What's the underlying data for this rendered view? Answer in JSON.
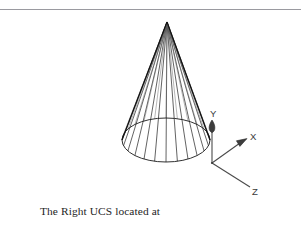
{
  "figure": {
    "title": "The Right UCS located at the new origin",
    "background_color": "#ffffff",
    "line_color": "#1a1a1a",
    "rule_color": "#9a9aa0",
    "text_color": "#252525"
  },
  "top_rule": {
    "name": "horizontal-rule",
    "y": 9,
    "color": "#9a9aa0"
  },
  "cone": {
    "name": "wireframe-cone",
    "apex": {
      "x": 167,
      "y": 22
    },
    "base_center": {
      "x": 166,
      "y": 140
    },
    "base_radius_x": 44,
    "base_radius_y": 22,
    "generator_count": 24,
    "shading": "wireframe"
  },
  "ucs_icon": {
    "name": "ucs-axis-icon",
    "origin": {
      "x": 212,
      "y": 163
    },
    "axes": [
      {
        "id": "y",
        "label": "Y",
        "tip": {
          "x": 212,
          "y": 122
        },
        "label_pos": {
          "x": 210,
          "y": 116
        },
        "arrowhead": "teardrop"
      },
      {
        "id": "x",
        "label": "X",
        "tip": {
          "x": 246,
          "y": 140
        },
        "label_pos": {
          "x": 250,
          "y": 139
        },
        "arrowhead": "triangle"
      },
      {
        "id": "z",
        "label": "Z",
        "tip": {
          "x": 250,
          "y": 187
        },
        "label_pos": {
          "x": 253,
          "y": 194
        },
        "arrowhead": "none"
      }
    ]
  },
  "caption": {
    "name": "figure-caption",
    "lines": [
      "The Right UCS located at",
      "the new origin"
    ],
    "line1": "The Right UCS located at",
    "line2": "the new origin"
  }
}
